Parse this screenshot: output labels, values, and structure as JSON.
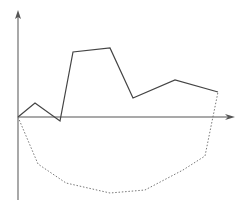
{
  "diagram": {
    "type": "line-plot-sketch",
    "axes": {
      "origin": [
        18,
        117
      ],
      "y_axis": {
        "from": [
          18,
          200
        ],
        "to": [
          18,
          10
        ],
        "arrow": "up",
        "color": "#7a7a7a"
      },
      "x_axis": {
        "from": [
          18,
          117
        ],
        "to": [
          235,
          117
        ],
        "arrow": "right",
        "color": "#555555"
      }
    },
    "series": [
      {
        "name": "solid-line",
        "style": "solid",
        "color": "#444444",
        "points": [
          [
            18,
            117
          ],
          [
            35,
            103
          ],
          [
            60,
            121
          ],
          [
            73,
            52
          ],
          [
            110,
            48
          ],
          [
            133,
            98
          ],
          [
            175,
            80
          ],
          [
            218,
            92
          ]
        ]
      },
      {
        "name": "dotted-line",
        "style": "dotted",
        "color": "#777777",
        "points": [
          [
            18,
            117
          ],
          [
            38,
            164
          ],
          [
            66,
            183
          ],
          [
            110,
            193
          ],
          [
            145,
            190
          ],
          [
            183,
            170
          ],
          [
            205,
            156
          ],
          [
            218,
            92
          ]
        ]
      }
    ]
  }
}
